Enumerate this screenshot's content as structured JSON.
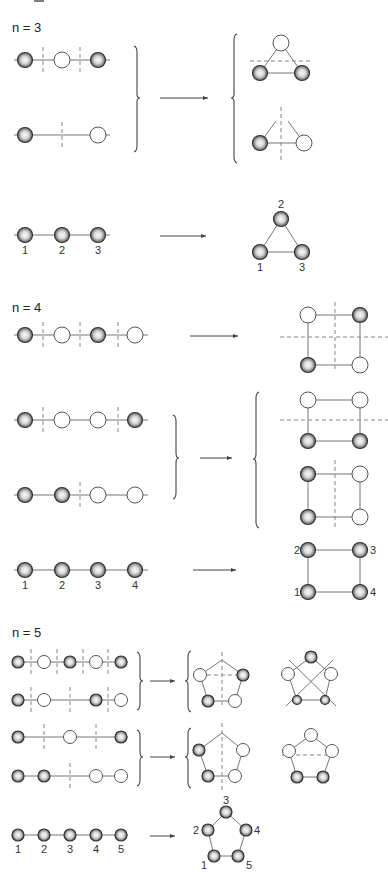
{
  "figure": {
    "top_fragment": "—",
    "sections": [
      {
        "label": "n = 3",
        "n": 3,
        "rows": [
          {
            "y": 60,
            "nodes": [
              {
                "x": 25,
                "t": "F"
              },
              {
                "x": 62,
                "t": "E"
              },
              {
                "x": 98,
                "t": "F"
              }
            ],
            "cuts": [
              43,
              80
            ],
            "x0": 14,
            "x1": 110
          },
          {
            "y": 135,
            "nodes": [
              {
                "x": 25,
                "t": "F"
              },
              {
                "x": 98,
                "t": "E"
              }
            ],
            "cuts": [
              62
            ],
            "x0": 14,
            "x1": 110
          }
        ],
        "labeled_row": {
          "y": 235,
          "nodes": [
            {
              "x": 25,
              "label": "1"
            },
            {
              "x": 62,
              "label": "2"
            },
            {
              "x": 98,
              "label": "3"
            }
          ],
          "x0": 14,
          "x1": 110
        },
        "arrows": [
          {
            "x1": 160,
            "x2": 208,
            "y": 98
          },
          {
            "x1": 160,
            "x2": 206,
            "y": 236
          }
        ]
      },
      {
        "label": "n = 4",
        "n": 4,
        "rows": [
          {
            "y": 335,
            "nodes": [
              {
                "x": 25,
                "t": "F"
              },
              {
                "x": 62,
                "t": "E"
              },
              {
                "x": 98,
                "t": "F"
              },
              {
                "x": 135,
                "t": "E"
              }
            ],
            "cuts": [
              43,
              80,
              118
            ],
            "x0": 14,
            "x1": 148
          },
          {
            "y": 420,
            "nodes": [
              {
                "x": 25,
                "t": "F"
              },
              {
                "x": 62,
                "t": "E"
              },
              {
                "x": 98,
                "t": "E"
              },
              {
                "x": 135,
                "t": "F"
              }
            ],
            "cuts": [
              43,
              118
            ],
            "x0": 14,
            "x1": 148
          },
          {
            "y": 495,
            "nodes": [
              {
                "x": 25,
                "t": "F"
              },
              {
                "x": 62,
                "t": "F"
              },
              {
                "x": 98,
                "t": "E"
              },
              {
                "x": 135,
                "t": "E"
              }
            ],
            "cuts": [
              80
            ],
            "x0": 14,
            "x1": 148
          }
        ],
        "labeled_row": {
          "y": 570,
          "nodes": [
            {
              "x": 25,
              "label": "1"
            },
            {
              "x": 62,
              "label": "2"
            },
            {
              "x": 98,
              "label": "3"
            },
            {
              "x": 135,
              "label": "4"
            }
          ],
          "x0": 14,
          "x1": 148
        },
        "arrows": [
          {
            "x1": 190,
            "x2": 238,
            "y": 336
          },
          {
            "x1": 200,
            "x2": 232,
            "y": 458
          },
          {
            "x1": 193,
            "x2": 236,
            "y": 570
          }
        ]
      },
      {
        "label": "n = 5",
        "n": 5,
        "rows": [
          {
            "y": 662,
            "nodes": [
              {
                "x": 18,
                "t": "F"
              },
              {
                "x": 44,
                "t": "E"
              },
              {
                "x": 70,
                "t": "F"
              },
              {
                "x": 96,
                "t": "E"
              },
              {
                "x": 121,
                "t": "F"
              }
            ],
            "cuts": [
              31,
              57,
              83,
              108
            ],
            "x0": 12,
            "x1": 128
          },
          {
            "y": 700,
            "nodes": [
              {
                "x": 18,
                "t": "F"
              },
              {
                "x": 44,
                "t": "E"
              },
              {
                "x": 96,
                "t": "F"
              },
              {
                "x": 121,
                "t": "E"
              }
            ],
            "cuts": [
              31,
              70,
              108
            ],
            "x0": 12,
            "x1": 128
          },
          {
            "y": 737,
            "nodes": [
              {
                "x": 18,
                "t": "F"
              },
              {
                "x": 70,
                "t": "E"
              },
              {
                "x": 121,
                "t": "F"
              }
            ],
            "cuts": [
              44,
              96
            ],
            "x0": 12,
            "x1": 128
          },
          {
            "y": 776,
            "nodes": [
              {
                "x": 18,
                "t": "F"
              },
              {
                "x": 44,
                "t": "F"
              },
              {
                "x": 96,
                "t": "E"
              },
              {
                "x": 121,
                "t": "E"
              }
            ],
            "cuts": [
              70
            ],
            "x0": 12,
            "x1": 128
          }
        ],
        "labeled_row": {
          "y": 835,
          "nodes": [
            {
              "x": 18,
              "label": "1"
            },
            {
              "x": 44,
              "label": "2"
            },
            {
              "x": 70,
              "label": "3"
            },
            {
              "x": 96,
              "label": "4"
            },
            {
              "x": 121,
              "label": "5"
            }
          ],
          "x0": 12,
          "x1": 128
        },
        "arrows": [
          {
            "x1": 150,
            "x2": 175,
            "y": 681
          },
          {
            "x1": 150,
            "x2": 175,
            "y": 757
          },
          {
            "x1": 150,
            "x2": 175,
            "y": 836
          }
        ]
      }
    ],
    "legend": {
      "filled": "F = shaded sphere (occupied site)",
      "empty": "E = open circle (empty site)"
    }
  }
}
